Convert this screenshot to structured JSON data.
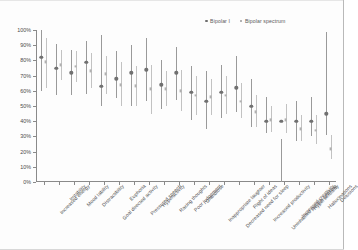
{
  "chart_data": {
    "type": "scatter",
    "title": "",
    "subtitle": "",
    "xlabel": "",
    "ylabel": "",
    "ylim": [
      0,
      100
    ],
    "grid": false,
    "legend_position": "top-right",
    "ytick_labels": [
      "100%",
      "90%",
      "80%",
      "70%",
      "60%",
      "50%",
      "40%",
      "30%",
      "20%",
      "10%",
      "0%"
    ],
    "ytick_values": [
      100,
      90,
      80,
      70,
      60,
      50,
      40,
      30,
      20,
      10,
      0
    ],
    "categories": [
      "Increased energy",
      "Irritability",
      "Mood lability",
      "Distractibility",
      "Goal directed activity",
      "Euphoria",
      "Pressured speech",
      "Hyperactivity",
      "Racing thoughts",
      "Poor judgement",
      "Grandiose",
      "Inappropriate laughter",
      "Decreased need for sleep",
      "Flight of ideas",
      "Increased productivity",
      "Uninhibited people seeking",
      "Increased creativity",
      "Hypersexuality",
      "Hallucinations",
      "Delusions"
    ],
    "series": [
      {
        "name": "Bipolar I",
        "marker": "circle",
        "color": "#707070",
        "values": [
          82,
          75,
          72,
          79,
          63,
          68,
          72,
          74,
          64,
          72,
          59,
          53,
          59,
          62,
          50,
          40,
          40,
          40,
          40,
          45
        ],
        "ci_low": [
          60,
          57,
          57,
          58,
          50,
          55,
          50,
          53,
          48,
          54,
          41,
          35,
          42,
          46,
          36,
          32,
          28,
          27,
          30,
          31
        ],
        "ci_high": [
          100,
          91,
          87,
          93,
          97,
          86,
          90,
          95,
          80,
          89,
          76,
          73,
          77,
          83,
          68,
          56,
          0,
          53,
          56,
          99
        ]
      },
      {
        "name": "Bipolar spectrum",
        "marker": "square",
        "color": "#b0b0b0",
        "values": [
          79,
          77,
          76,
          73,
          71,
          64,
          63,
          61,
          61,
          60,
          57,
          56,
          57,
          53,
          46,
          41,
          41,
          35,
          34,
          22
        ],
        "ci_low": [
          62,
          67,
          66,
          62,
          58,
          50,
          50,
          45,
          50,
          47,
          44,
          44,
          45,
          42,
          36,
          33,
          32,
          27,
          25,
          15
        ],
        "ci_high": [
          95,
          87,
          86,
          85,
          83,
          79,
          76,
          77,
          73,
          74,
          70,
          68,
          70,
          65,
          57,
          50,
          51,
          44,
          44,
          31
        ]
      }
    ],
    "legend": [
      "Bipolar I",
      "Bipolar spectrum"
    ]
  }
}
